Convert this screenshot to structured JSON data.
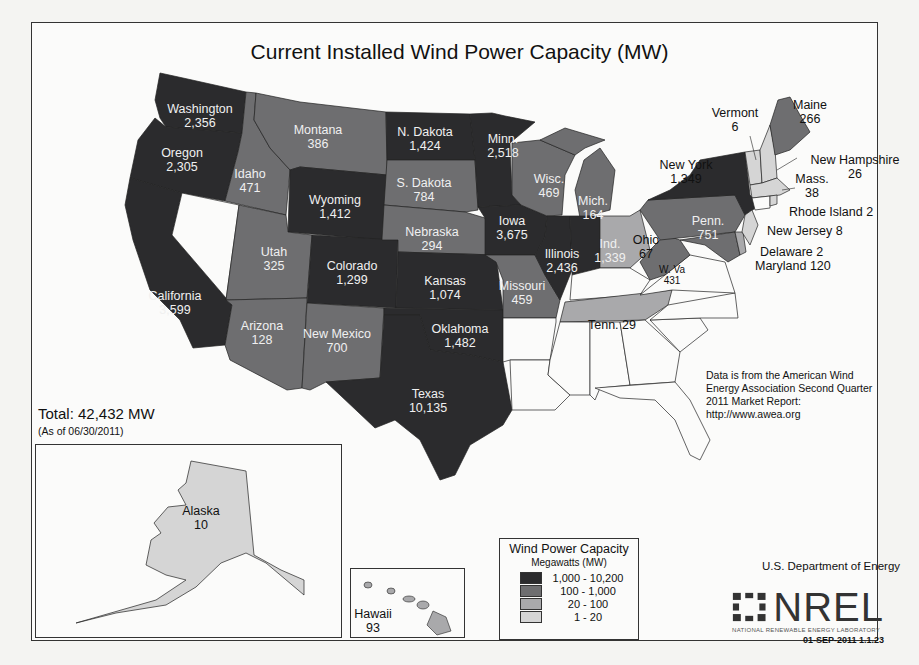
{
  "title": "Current Installed Wind Power Capacity (MW)",
  "total": {
    "label": "Total:  42,432 MW",
    "as_of": "(As of 06/30/2011)"
  },
  "source_note": [
    "Data is from the American Wind",
    "Energy Association Second Quarter",
    "2011 Market Report:",
    "http://www.awea.org"
  ],
  "legend": {
    "title": "Wind Power Capacity",
    "subtitle": "Megawatts (MW)",
    "items": [
      {
        "range": "1,000 - 10,200",
        "color": "#2b2b2d"
      },
      {
        "range": "100 - 1,000",
        "color": "#6e6e70"
      },
      {
        "range": "20 - 100",
        "color": "#a9a9ab"
      },
      {
        "range": "1 - 20",
        "color": "#d5d5d5"
      }
    ]
  },
  "credits": {
    "agency": "U.S. Department of Energy",
    "logo_text": "NREL",
    "logo_subtext": "NATIONAL RENEWABLE ENERGY LABORATORY",
    "version": "01-SEP-2011 1.1.23"
  },
  "states": {
    "washington": {
      "name": "Washington",
      "mw": "2,356"
    },
    "oregon": {
      "name": "Oregon",
      "mw": "2,305"
    },
    "california": {
      "name": "California",
      "mw": "3,599"
    },
    "idaho": {
      "name": "Idaho",
      "mw": "471"
    },
    "montana": {
      "name": "Montana",
      "mw": "386"
    },
    "wyoming": {
      "name": "Wyoming",
      "mw": "1,412"
    },
    "utah": {
      "name": "Utah",
      "mw": "325"
    },
    "colorado": {
      "name": "Colorado",
      "mw": "1,299"
    },
    "arizona": {
      "name": "Arizona",
      "mw": "128"
    },
    "new_mexico": {
      "name": "New Mexico",
      "mw": "700"
    },
    "n_dakota": {
      "name": "N. Dakota",
      "mw": "1,424"
    },
    "s_dakota": {
      "name": "S. Dakota",
      "mw": "784"
    },
    "nebraska": {
      "name": "Nebraska",
      "mw": "294"
    },
    "kansas": {
      "name": "Kansas",
      "mw": "1,074"
    },
    "oklahoma": {
      "name": "Oklahoma",
      "mw": "1,482"
    },
    "texas": {
      "name": "Texas",
      "mw": "10,135"
    },
    "minnesota": {
      "name": "Minn.",
      "mw": "2,518"
    },
    "iowa": {
      "name": "Iowa",
      "mw": "3,675"
    },
    "missouri": {
      "name": "Missouri",
      "mw": "459"
    },
    "wisconsin": {
      "name": "Wisc.",
      "mw": "469"
    },
    "illinois": {
      "name": "Illinois",
      "mw": "2,436"
    },
    "michigan": {
      "name": "Mich.",
      "mw": "164"
    },
    "indiana": {
      "name": "Ind.",
      "mw": "1,339"
    },
    "ohio": {
      "name": "Ohio",
      "mw": "67"
    },
    "tennessee": {
      "name": "Tenn.",
      "mw": "29",
      "label": "Tenn.  29"
    },
    "west_virginia": {
      "name": "W. Va",
      "mw": "431"
    },
    "pennsylvania": {
      "name": "Penn.",
      "mw": "751"
    },
    "new_york": {
      "name": "New York",
      "mw": "1,349"
    },
    "vermont": {
      "name": "Vermont",
      "mw": "6"
    },
    "maine": {
      "name": "Maine",
      "mw": "266"
    },
    "new_hampshire": {
      "name": "New Hampshire",
      "mw": "26"
    },
    "massachusetts": {
      "name": "Mass.",
      "mw": "38"
    },
    "rhode_island": {
      "name": "Rhode Island",
      "mw": "2",
      "label": "Rhode Island 2"
    },
    "new_jersey": {
      "name": "New Jersey",
      "mw": "8",
      "label": "New Jersey 8"
    },
    "delaware": {
      "name": "Delaware",
      "mw": "2",
      "label": "Delaware 2"
    },
    "maryland": {
      "name": "Maryland",
      "mw": "120",
      "label": "Maryland 120"
    },
    "alaska": {
      "name": "Alaska",
      "mw": "10"
    },
    "hawaii": {
      "name": "Hawaii",
      "mw": "93"
    }
  }
}
